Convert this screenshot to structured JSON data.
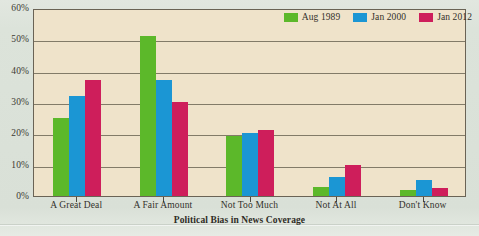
{
  "chart_data": {
    "type": "bar",
    "title": "",
    "xlabel": "Political Bias in News Coverage",
    "ylabel": "",
    "categories": [
      "A Great Deal",
      "A Fair Amount",
      "Not Too Much",
      "Not At All",
      "Don't Know"
    ],
    "series": [
      {
        "name": "Aug 1989",
        "color": "#5cb82a",
        "values": [
          25,
          51,
          19,
          3,
          2
        ]
      },
      {
        "name": "Jan 2000",
        "color": "#1b96d4",
        "values": [
          32,
          37,
          20,
          6,
          5
        ]
      },
      {
        "name": "Jan 2012",
        "color": "#ce1e5b",
        "values": [
          37,
          30,
          21,
          10,
          2.5
        ]
      }
    ],
    "ylim": [
      0,
      60
    ],
    "yticks": [
      "0%",
      "10%",
      "20%",
      "30%",
      "40%",
      "50%",
      "60%"
    ],
    "ytick_values": [
      0,
      10,
      20,
      30,
      40,
      50,
      60
    ],
    "grid": true,
    "legend_position": "top-right"
  },
  "colors": {
    "page_background": "#dce3da",
    "plot_background": "#efe3ca",
    "axis": "#6a6355",
    "gridline": "#6f6857",
    "text": "#33312b",
    "series_1": "#5cb82a",
    "series_2": "#1b96d4",
    "series_3": "#ce1e5b"
  }
}
